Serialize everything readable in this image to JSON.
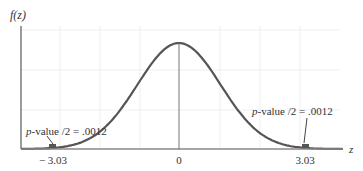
{
  "chart_data": {
    "type": "area",
    "title": "",
    "ylabel": "f(z)",
    "xlabel": "z",
    "xlim": [
      -3.6,
      3.6
    ],
    "x_ticks": [
      {
        "value": -3.03,
        "label": "− 3.03"
      },
      {
        "value": 0,
        "label": "0"
      },
      {
        "value": 3.03,
        "label": "3.03"
      }
    ],
    "curve": "standard normal density",
    "shaded_regions": [
      {
        "from": -3.6,
        "to": -3.03,
        "tail": "left"
      },
      {
        "from": 3.03,
        "to": 3.6,
        "tail": "right"
      }
    ],
    "annotations": [
      {
        "text_prefix": "p",
        "text": "-value /2 = .0012",
        "points_to": -3.03
      },
      {
        "text_prefix": "p",
        "text": "-value /2 = .0012",
        "points_to": 3.03
      }
    ],
    "grid": true,
    "colors": {
      "curve": "#555555",
      "axis": "#666666",
      "grid": "#eeeeee",
      "shade": "#555555"
    }
  }
}
